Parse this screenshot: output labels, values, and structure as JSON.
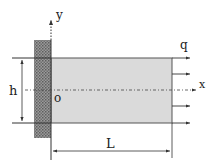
{
  "diagram": {
    "type": "cantilever-plate",
    "labels": {
      "y_axis": "y",
      "x_axis": "x",
      "origin": "o",
      "height": "h",
      "length": "L",
      "load": "q"
    },
    "colors": {
      "plate_fill": "#d9d9d9",
      "wall_fill": "#8a8a8a",
      "line": "#333333",
      "background": "#ffffff"
    },
    "load_arrow_count": 5
  }
}
